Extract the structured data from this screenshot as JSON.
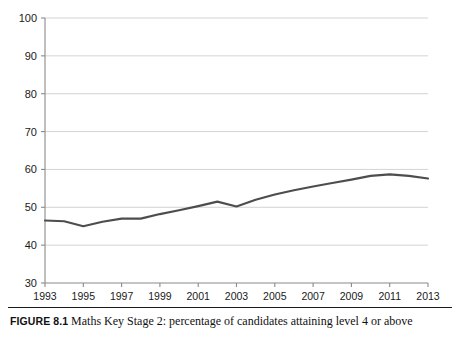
{
  "caption": {
    "label": "FIGURE 8.1",
    "text": "Maths Key Stage 2: percentage of candidates attaining level 4 or above"
  },
  "chart_data": {
    "type": "line",
    "title": "",
    "xlabel": "",
    "ylabel": "",
    "xlim": [
      1993,
      2013
    ],
    "ylim": [
      30,
      100
    ],
    "ytick_values": [
      30,
      40,
      50,
      60,
      70,
      80,
      90,
      100
    ],
    "ytick_labels": [
      "30",
      "40",
      "50",
      "60",
      "70",
      "80",
      "90",
      "100"
    ],
    "xtick_values": [
      1993,
      1995,
      1997,
      1999,
      2001,
      2003,
      2005,
      2007,
      2009,
      2011,
      2013
    ],
    "xtick_labels": [
      "1993",
      "1995",
      "1997",
      "1999",
      "2001",
      "2003",
      "2005",
      "2007",
      "2009",
      "2011",
      "2013"
    ],
    "grid": "horizontal",
    "legend": "none",
    "x": [
      1993,
      1994,
      1995,
      1996,
      1997,
      1998,
      1999,
      2000,
      2001,
      2002,
      2003,
      2004,
      2005,
      2006,
      2007,
      2008,
      2009,
      2010,
      2011,
      2012,
      2013
    ],
    "series": [
      {
        "name": "Percentage attaining level 4 or above",
        "color": "#4d4d4d",
        "values": [
          46.5,
          46.3,
          45.0,
          46.2,
          47.0,
          47.0,
          48.2,
          49.2,
          50.3,
          51.5,
          50.2,
          52.0,
          53.4,
          54.5,
          55.5,
          56.4,
          57.3,
          58.3,
          58.7,
          58.3,
          57.6
        ]
      }
    ]
  }
}
